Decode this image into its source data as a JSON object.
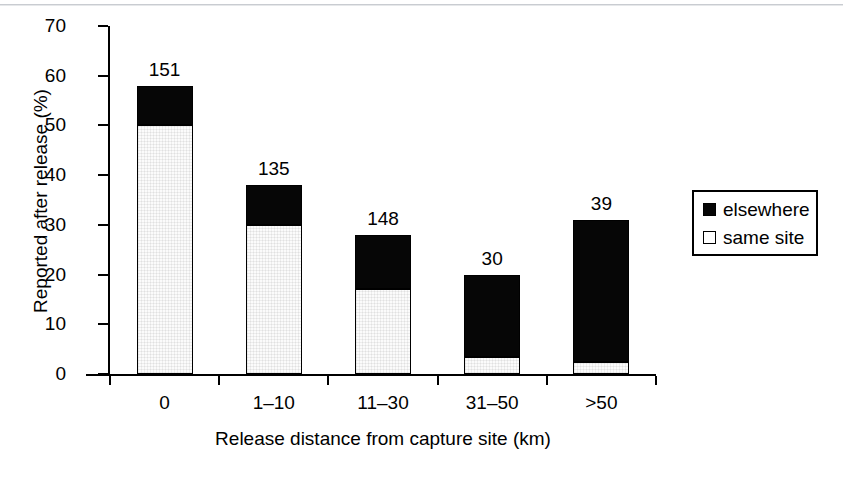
{
  "chart_data": {
    "type": "bar",
    "subtype": "stacked-bar",
    "title": "",
    "xlabel": "Release distance from capture site (km)",
    "ylabel": "Reported after release (%)",
    "categories": [
      "0",
      "1–10",
      "11–30",
      "31–50",
      ">50"
    ],
    "series": [
      {
        "name": "same site",
        "values": [
          50,
          30,
          17,
          3.5,
          2.5
        ]
      },
      {
        "name": "elsewhere",
        "values": [
          8,
          8,
          11,
          16.5,
          28.5
        ]
      }
    ],
    "totals": [
      58,
      38,
      28,
      20,
      31
    ],
    "bar_labels": [
      "151",
      "135",
      "148",
      "30",
      "39"
    ],
    "ylim": [
      0,
      70
    ],
    "yticks": [
      0,
      10,
      20,
      30,
      40,
      50,
      60,
      70
    ],
    "ytick_labels": [
      "0",
      "10",
      "20",
      "30",
      "40",
      "50",
      "60",
      "70"
    ],
    "grid": false,
    "legend_position": "right",
    "colors": {
      "elsewhere": "#060606",
      "same_site": "#ffffff",
      "axis": "#000000",
      "background": "#ffffff"
    }
  },
  "axes": {
    "y_title": "Reported after release (%)",
    "x_title": "Release distance from capture site (km)",
    "y_ticks": [
      {
        "label": "70",
        "value": 70
      },
      {
        "label": "60",
        "value": 60
      },
      {
        "label": "50",
        "value": 50
      },
      {
        "label": "40",
        "value": 40
      },
      {
        "label": "30",
        "value": 30
      },
      {
        "label": "20",
        "value": 20
      },
      {
        "label": "10",
        "value": 10
      },
      {
        "label": "0",
        "value": 0
      }
    ],
    "x_ticks": [
      {
        "label": "0"
      },
      {
        "label": "1–10"
      },
      {
        "label": "11–30"
      },
      {
        "label": "31–50"
      },
      {
        "label": ">50"
      }
    ]
  },
  "bars": [
    {
      "category": "0",
      "same_site": 50,
      "total": 58,
      "label": "151"
    },
    {
      "category": "1–10",
      "same_site": 30,
      "total": 38,
      "label": "135"
    },
    {
      "category": "11–30",
      "same_site": 17,
      "total": 28,
      "label": "148"
    },
    {
      "category": "31–50",
      "same_site": 3.5,
      "total": 20,
      "label": "30"
    },
    {
      "category": ">50",
      "same_site": 2.5,
      "total": 31,
      "label": "39"
    }
  ],
  "legend": {
    "items": [
      {
        "label": "elsewhere",
        "swatch": "filled"
      },
      {
        "label": "same site",
        "swatch": "hollow"
      }
    ]
  }
}
